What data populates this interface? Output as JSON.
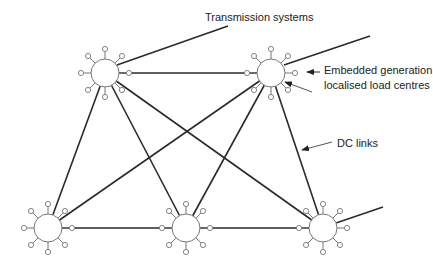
{
  "diagram": {
    "labels": {
      "transmission": "Transmission systems",
      "embedded_1": "Embedded generation",
      "embedded_2": "localised load centres",
      "dc_links": "DC links"
    },
    "nodes": [
      {
        "id": "node-top-left",
        "x": 105,
        "y": 73
      },
      {
        "id": "node-top-right",
        "x": 271,
        "y": 73
      },
      {
        "id": "node-bottom-left",
        "x": 48,
        "y": 228
      },
      {
        "id": "node-bottom-middle",
        "x": 186,
        "y": 228
      },
      {
        "id": "node-bottom-right",
        "x": 323,
        "y": 228
      }
    ],
    "links": [
      [
        "node-top-left",
        "node-top-right"
      ],
      [
        "node-top-left",
        "node-bottom-left"
      ],
      [
        "node-top-left",
        "node-bottom-middle"
      ],
      [
        "node-top-left",
        "node-bottom-right"
      ],
      [
        "node-top-right",
        "node-bottom-left"
      ],
      [
        "node-top-right",
        "node-bottom-middle"
      ],
      [
        "node-top-right",
        "node-bottom-right"
      ],
      [
        "node-bottom-left",
        "node-bottom-middle"
      ],
      [
        "node-bottom-middle",
        "node-bottom-right"
      ]
    ],
    "colors": {
      "line": "#2a2a2a",
      "spoke": "#777777"
    }
  }
}
